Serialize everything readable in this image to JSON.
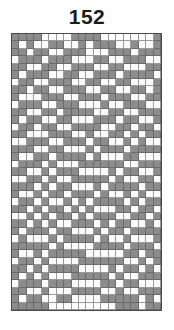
{
  "title": "152",
  "grid": {
    "columns": 20,
    "rows": 37,
    "colors": {
      "filled": "#8c8c8c",
      "empty": "#fbfbfb",
      "line": "#4a4a4a"
    },
    "pattern": [
      "11110000111100000001",
      "10100110010111001001",
      "11011001110001110111",
      "01110111000110011100",
      "11001100111001100011",
      "10111001100111011110",
      "01100111001100110001",
      "11011001110011001101",
      "10001110011101110011",
      "01110011100010011100",
      "11001101111001100111",
      "10110011000111011001",
      "01101100111100110110",
      "11000111001001101011",
      "00111001110110010100",
      "11100110001011101111",
      "10011011110100011000",
      "01110100011111100111",
      "11001011100001011001",
      "00110100111110100110",
      "11101011000101111011",
      "10010110111010010100",
      "01101001010111101011",
      "11010110101000110110",
      "00101011010111001101",
      "11010100111010110010",
      "10111011000101101111",
      "01000101111010010001",
      "11111010000111101110",
      "10010111110000011011",
      "01101000011111100101",
      "11010111100001011010",
      "10101000111110100111",
      "01110111000011011000",
      "11001000111100100111",
      "10110011000011111010",
      "11111000000000111011"
    ]
  }
}
